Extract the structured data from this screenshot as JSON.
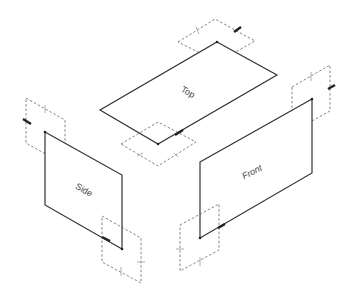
{
  "diagram": {
    "type": "isometric-planes",
    "planes": [
      {
        "id": "top",
        "label": "Top"
      },
      {
        "id": "side",
        "label": "Side"
      },
      {
        "id": "front",
        "label": "Front"
      }
    ],
    "colors": {
      "line": "#333333",
      "dash": "#666666",
      "background": "#ffffff"
    }
  }
}
